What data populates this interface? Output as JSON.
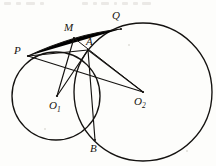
{
  "figure": {
    "kind": "geometry-diagram",
    "width": 216,
    "height": 166,
    "background_color": "#fdfdfb",
    "ink_color": "#141210"
  },
  "labels": {
    "P": {
      "text": "P",
      "x": 14,
      "y": 45
    },
    "M": {
      "text": "M",
      "x": 64,
      "y": 22
    },
    "A": {
      "text": "A",
      "x": 86,
      "y": 36
    },
    "Q": {
      "text": "Q",
      "x": 112,
      "y": 10
    },
    "B": {
      "text": "B",
      "x": 90,
      "y": 143
    },
    "O1": {
      "text": "O",
      "sub": "1",
      "x": 49,
      "y": 100
    },
    "O2": {
      "text": "O",
      "sub": "2",
      "x": 134,
      "y": 96
    }
  },
  "points": {
    "P": {
      "x": 28,
      "y": 56
    },
    "M": {
      "x": 74,
      "y": 38
    },
    "A": {
      "x": 88,
      "y": 50
    },
    "Q": {
      "x": 121,
      "y": 29
    },
    "B": {
      "x": 95,
      "y": 140
    },
    "O1": {
      "x": 57,
      "y": 96
    },
    "O2": {
      "x": 143,
      "y": 92
    }
  },
  "circles": [
    {
      "name": "circle-o1",
      "cx": 56,
      "cy": 96,
      "r": 44
    },
    {
      "name": "circle-o2",
      "cx": 143,
      "cy": 92,
      "r": 69
    }
  ],
  "segments": [
    {
      "name": "segment-p-q",
      "from": "P",
      "to": "Q"
    },
    {
      "name": "segment-p-a",
      "from": "P",
      "to": "A"
    },
    {
      "name": "segment-p-o2",
      "from": "P",
      "to": "O2"
    },
    {
      "name": "segment-o1-m",
      "from": "O1",
      "to": "M"
    },
    {
      "name": "segment-o1-a",
      "from": "O1",
      "to": "A"
    },
    {
      "name": "segment-m-o2",
      "from": "M",
      "to": "O2"
    },
    {
      "name": "segment-a-o2",
      "from": "A",
      "to": "O2"
    },
    {
      "name": "segment-a-b",
      "from": "A",
      "to": "B"
    }
  ]
}
